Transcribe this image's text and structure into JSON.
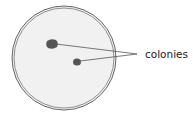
{
  "diagram": {
    "label": "colonies",
    "colors": {
      "dish_fill": "#f1f1f1",
      "dish_rim": "#666666",
      "colony": "#555555",
      "line": "#555555"
    }
  }
}
